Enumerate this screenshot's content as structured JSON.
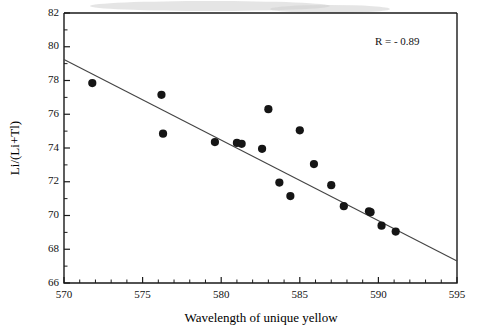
{
  "chart_data": {
    "type": "scatter",
    "title": "",
    "xlabel": "Wavelength of unique yellow",
    "ylabel": "Li/(Li+Tl)",
    "xlim": [
      570,
      595
    ],
    "ylim": [
      66,
      82
    ],
    "xticks": [
      570,
      575,
      580,
      585,
      590,
      595
    ],
    "xtick_labels": [
      "570",
      "575",
      "580",
      "585",
      "590",
      "595"
    ],
    "yticks": [
      66,
      68,
      70,
      72,
      74,
      76,
      78,
      80,
      82
    ],
    "ytick_labels": [
      "66",
      "68",
      "70",
      "72",
      "74",
      "76",
      "78",
      "80",
      "82"
    ],
    "x_minor_step": 1,
    "y_minor_step": 1,
    "grid": false,
    "legend": null,
    "annotations": [
      {
        "text": "R =  - 0.89",
        "x": 591.2,
        "y": 80.1
      }
    ],
    "series": [
      {
        "name": "observers",
        "marker": "filled-circle",
        "color": "#151515",
        "points": [
          {
            "x": 571.8,
            "y": 77.85
          },
          {
            "x": 576.2,
            "y": 77.15
          },
          {
            "x": 576.3,
            "y": 74.85
          },
          {
            "x": 579.6,
            "y": 74.35
          },
          {
            "x": 581.0,
            "y": 74.3
          },
          {
            "x": 581.3,
            "y": 74.25
          },
          {
            "x": 582.6,
            "y": 73.95
          },
          {
            "x": 583.0,
            "y": 76.3
          },
          {
            "x": 585.0,
            "y": 75.05
          },
          {
            "x": 583.7,
            "y": 71.95
          },
          {
            "x": 584.4,
            "y": 71.15
          },
          {
            "x": 585.9,
            "y": 73.05
          },
          {
            "x": 587.0,
            "y": 71.8
          },
          {
            "x": 587.8,
            "y": 70.55
          },
          {
            "x": 589.4,
            "y": 70.25
          },
          {
            "x": 589.5,
            "y": 70.2
          },
          {
            "x": 590.2,
            "y": 69.4
          },
          {
            "x": 591.1,
            "y": 69.05
          }
        ]
      }
    ],
    "fit_line": {
      "name": "regression-line",
      "x_start": 570.0,
      "y_start": 79.25,
      "x_end": 595.0,
      "y_end": 67.3,
      "color": "#444444"
    },
    "correlation": "-0.89"
  }
}
